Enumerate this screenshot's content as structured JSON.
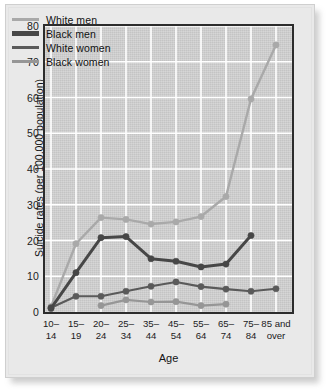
{
  "chart_data": {
    "type": "line",
    "title": "",
    "xlabel": "Age",
    "ylabel": "Suicide rates (per 100,000 population)",
    "categories": [
      "10–14",
      "15–19",
      "20–24",
      "25–34",
      "35–44",
      "45–54",
      "55–64",
      "65–74",
      "75–84",
      "85 and over"
    ],
    "category_lines": [
      [
        "10–",
        "14"
      ],
      [
        "15–",
        "19"
      ],
      [
        "20–",
        "24"
      ],
      [
        "25–",
        "34"
      ],
      [
        "35–",
        "44"
      ],
      [
        "45–",
        "54"
      ],
      [
        "55–",
        "64"
      ],
      [
        "65–",
        "74"
      ],
      [
        "75–",
        "84"
      ],
      [
        "85 and",
        "over"
      ]
    ],
    "ylim": [
      0,
      80
    ],
    "yticks": [
      0,
      10,
      20,
      30,
      40,
      50,
      60,
      70,
      80
    ],
    "grid": true,
    "grid_color": "#ffffff",
    "plot_background": "#d2d2d2",
    "legend_position": "top-left",
    "series": [
      {
        "name": "White men",
        "color": "#a9a9a9",
        "line_width": 2.4,
        "values": [
          1.5,
          19.1,
          26.4,
          25.9,
          24.6,
          25.2,
          26.7,
          32.3,
          59.6,
          74.7
        ]
      },
      {
        "name": "Black men",
        "color": "#474747",
        "line_width": 3.0,
        "values": [
          1.0,
          11.0,
          20.8,
          21.1,
          14.9,
          14.2,
          12.6,
          13.4,
          21.4,
          null
        ]
      },
      {
        "name": "White women",
        "color": "#5a5a5a",
        "line_width": 2.2,
        "values": [
          1.2,
          4.4,
          4.4,
          5.8,
          7.2,
          8.4,
          7.1,
          6.4,
          5.8,
          6.5
        ]
      },
      {
        "name": "Black women",
        "color": "#969696",
        "line_width": 2.2,
        "values": [
          null,
          null,
          1.8,
          3.4,
          2.8,
          2.9,
          1.8,
          2.2,
          null,
          null
        ]
      }
    ]
  }
}
